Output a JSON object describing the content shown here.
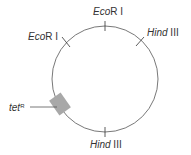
{
  "diagram": {
    "type": "plasmid-map",
    "sites": [
      {
        "name_italic": "Eco",
        "name_rest": "R I",
        "position": "top"
      },
      {
        "name_italic": "Eco",
        "name_rest": "R I",
        "position": "upper-left"
      },
      {
        "name_italic": "Hind",
        "name_rest": " III",
        "position": "upper-right"
      },
      {
        "name_italic": "Hind",
        "name_rest": " III",
        "position": "bottom"
      }
    ],
    "gene": {
      "name_italic": "tet",
      "superscript": "R",
      "position": "left"
    },
    "colors": {
      "line": "#555555",
      "gene_box": "#a8a8a8"
    }
  }
}
